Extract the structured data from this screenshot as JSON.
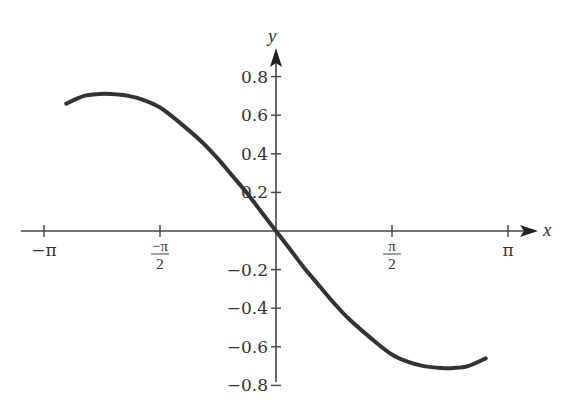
{
  "chart_data": {
    "type": "line",
    "title": "",
    "xlabel": "x",
    "ylabel": "y",
    "xlim": [
      -3.14159,
      3.14159
    ],
    "ylim": [
      -0.8,
      0.8
    ],
    "grid": false,
    "legend": null,
    "x_ticks": [
      {
        "value": -3.14159,
        "label": "−π",
        "kind": "plain"
      },
      {
        "value": -1.5708,
        "label_num": "−π",
        "label_den": "2",
        "kind": "fraction"
      },
      {
        "value": 1.5708,
        "label_num": "π",
        "label_den": "2",
        "kind": "fraction"
      },
      {
        "value": 3.14159,
        "label": "π",
        "kind": "plain"
      }
    ],
    "y_ticks": [
      {
        "value": 0.8,
        "label": "0.8"
      },
      {
        "value": 0.6,
        "label": "0.6"
      },
      {
        "value": 0.4,
        "label": "0.4"
      },
      {
        "value": 0.2,
        "label": "0.2"
      },
      {
        "value": -0.2,
        "label": "−0.2"
      },
      {
        "value": -0.4,
        "label": "−0.4"
      },
      {
        "value": -0.6,
        "label": "−0.6"
      },
      {
        "value": -0.8,
        "label": "−0.8"
      }
    ],
    "series": [
      {
        "name": "y = f(x)",
        "color": "#333333",
        "x": [
          -2.84,
          -2.6,
          -2.4,
          -2.24,
          -2.0,
          -1.8,
          -1.57,
          -1.3,
          -1.0,
          -0.8,
          -0.6,
          -0.4,
          -0.2,
          0,
          0.2,
          0.4,
          0.6,
          0.8,
          1.0,
          1.3,
          1.57,
          1.8,
          2.0,
          2.24,
          2.4,
          2.6,
          2.84
        ],
        "y": [
          0.66,
          0.7,
          0.71,
          0.71,
          0.7,
          0.68,
          0.64,
          0.56,
          0.46,
          0.38,
          0.29,
          0.2,
          0.1,
          0,
          -0.1,
          -0.2,
          -0.29,
          -0.38,
          -0.46,
          -0.56,
          -0.64,
          -0.68,
          -0.7,
          -0.71,
          -0.71,
          -0.7,
          -0.66
        ]
      }
    ]
  },
  "axes": {
    "x_label": "x",
    "y_label": "y"
  }
}
